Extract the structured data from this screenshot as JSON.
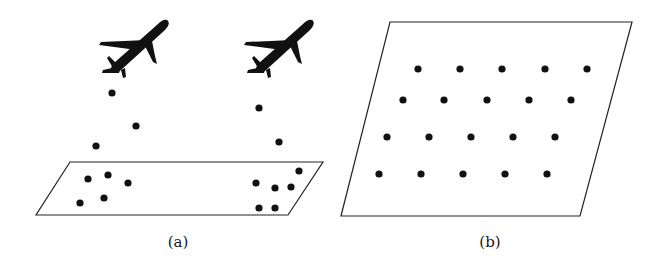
{
  "figure": {
    "background": "#ffffff",
    "ink": "#111111",
    "panels": [
      {
        "id": "a",
        "caption": "(a)",
        "caption_pos": [
          178,
          233
        ],
        "description": "Two airplanes dropping dots that land clustered in a ground parallelogram",
        "plane_outline": [
          [
            70,
            162
          ],
          [
            323,
            162
          ],
          [
            288,
            215
          ],
          [
            36,
            215
          ]
        ],
        "airplanes": [
          {
            "name": "airplane-left",
            "x": 97,
            "y": 18
          },
          {
            "name": "airplane-right",
            "x": 242,
            "y": 18
          }
        ],
        "falling_dots": [
          [
            112,
            93
          ],
          [
            136,
            126
          ],
          [
            96,
            146
          ],
          [
            259,
            108
          ],
          [
            279,
            142
          ]
        ],
        "ground_dots": [
          [
            88,
            179
          ],
          [
            108,
            175
          ],
          [
            128,
            183
          ],
          [
            80,
            203
          ],
          [
            104,
            198
          ],
          [
            256,
            183
          ],
          [
            275,
            188
          ],
          [
            291,
            187
          ],
          [
            299,
            171
          ],
          [
            259,
            208
          ],
          [
            275,
            208
          ]
        ]
      },
      {
        "id": "b",
        "caption": "(b)",
        "caption_pos": [
          490,
          233
        ],
        "description": "Parallelogram with a regular grid of evenly spaced dots",
        "plane_outline": [
          [
            390,
            22
          ],
          [
            632,
            22
          ],
          [
            580,
            216
          ],
          [
            341,
            216
          ]
        ],
        "grid_rows": [
          {
            "y": 69,
            "xs": [
              418,
              460,
              502,
              545,
              587
            ]
          },
          {
            "y": 100,
            "xs": [
              403,
              444,
              487,
              529,
              571
            ]
          },
          {
            "y": 137,
            "xs": [
              387,
              429,
              471,
              513,
              555
            ]
          },
          {
            "y": 174,
            "xs": [
              379,
              421,
              463,
              505,
              547
            ]
          }
        ]
      }
    ]
  }
}
